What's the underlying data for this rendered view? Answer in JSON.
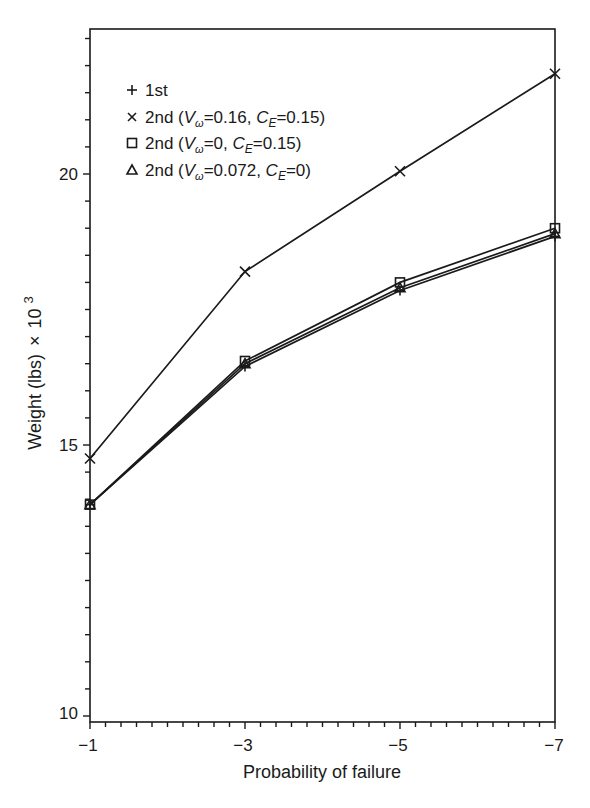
{
  "chart_data": {
    "type": "line",
    "title": "",
    "xlabel": "Probability of failure",
    "ylabel": "Weight (lbs) × 10^3",
    "x": [
      -1,
      -3,
      -5,
      -7
    ],
    "x_tick_labels": [
      "−1",
      "−3",
      "−5",
      "−7"
    ],
    "y_tick_labels": [
      "10",
      "15",
      "20"
    ],
    "y_ticks": [
      10,
      15,
      20
    ],
    "xlim": [
      -1,
      -7
    ],
    "ylim": [
      9.87,
      22.65
    ],
    "grid": false,
    "legend_position": "upper left",
    "series": [
      {
        "name": "1st",
        "marker": "plus",
        "values": [
          13.9,
          16.45,
          17.85,
          18.85
        ]
      },
      {
        "name": "2nd (Vω=0.16, CE=0.15)",
        "marker": "x",
        "values": [
          14.75,
          18.2,
          20.05,
          21.85
        ]
      },
      {
        "name": "2nd (Vω=0, CE=0.15)",
        "marker": "square",
        "values": [
          13.9,
          16.55,
          18.0,
          19.0
        ]
      },
      {
        "name": "2nd (Vω=0.072, CE=0)",
        "marker": "triangle",
        "values": [
          13.9,
          16.5,
          17.9,
          18.9
        ]
      }
    ]
  },
  "axes": {
    "xlabel": "Probability of failure",
    "ylabel_main": "Weight (lbs)",
    "ylabel_times": "×",
    "ylabel_base": "10",
    "ylabel_exp": "3",
    "x_ticks": [
      "−1",
      "−3",
      "−5",
      "−7"
    ],
    "y_ticks": [
      "10",
      "15",
      "20"
    ]
  },
  "legend": {
    "items": [
      {
        "prefix": "1st"
      },
      {
        "prefix": "2nd (",
        "v": "V",
        "vsub": "ω",
        "veq": "=0.16, ",
        "c": "C",
        "csub": "E",
        "ceq": "=0.15)"
      },
      {
        "prefix": "2nd (",
        "v": "V",
        "vsub": "ω",
        "veq": "=0, ",
        "c": "C",
        "csub": "E",
        "ceq": "=0.15)"
      },
      {
        "prefix": "2nd (",
        "v": "V",
        "vsub": "ω",
        "veq": "=0.072, ",
        "c": "C",
        "csub": "E",
        "ceq": "=0)"
      }
    ]
  },
  "colors": {
    "ink": "#1a1a1a",
    "background": "#ffffff"
  }
}
